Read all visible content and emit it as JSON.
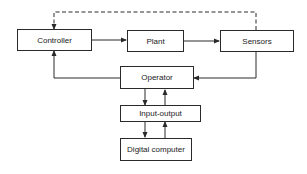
{
  "diagram": {
    "blocks": {
      "controller": "Controller",
      "plant": "Plant",
      "sensors": "Sensors",
      "operator": "Operator",
      "io": "Input-output",
      "computer": "Digital computer"
    },
    "connections": [
      {
        "from": "Controller",
        "to": "Plant",
        "style": "solid"
      },
      {
        "from": "Plant",
        "to": "Sensors",
        "style": "solid"
      },
      {
        "from": "Sensors",
        "to": "Controller",
        "style": "dashed"
      },
      {
        "from": "Sensors",
        "to": "Operator",
        "style": "solid"
      },
      {
        "from": "Operator",
        "to": "Controller",
        "style": "solid"
      },
      {
        "from": "Operator",
        "to": "Input-output",
        "style": "solid"
      },
      {
        "from": "Input-output",
        "to": "Operator",
        "style": "solid"
      },
      {
        "from": "Input-output",
        "to": "Digital computer",
        "style": "solid"
      },
      {
        "from": "Digital computer",
        "to": "Input-output",
        "style": "solid"
      }
    ],
    "colors": {
      "line": "#2a2a2a",
      "background": "#ffffff"
    }
  }
}
